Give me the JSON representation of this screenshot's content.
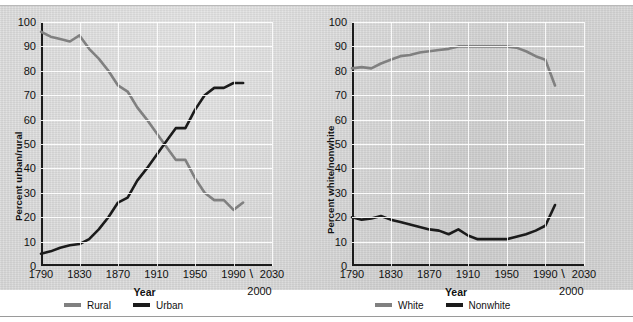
{
  "chart_data": [
    {
      "type": "line",
      "title": "",
      "xlabel": "Year",
      "ylabel": "Percent urban/rural",
      "xlim": [
        1790,
        2030
      ],
      "ylim": [
        0,
        100
      ],
      "grid": true,
      "legend_position": "bottom",
      "x_ticks": [
        "1790",
        "1830",
        "1870",
        "1910",
        "1950",
        "1990",
        "2030"
      ],
      "y_ticks": [
        "0",
        "10",
        "20",
        "30",
        "40",
        "50",
        "60",
        "70",
        "80",
        "90",
        "100"
      ],
      "annotation": "2000",
      "x": [
        1790,
        1800,
        1810,
        1820,
        1830,
        1840,
        1850,
        1860,
        1870,
        1880,
        1890,
        1900,
        1910,
        1920,
        1930,
        1940,
        1950,
        1960,
        1970,
        1980,
        1990,
        2000
      ],
      "series": [
        {
          "name": "Rural",
          "color": "#808080",
          "values": [
            96,
            94,
            93,
            92,
            94.5,
            89,
            85,
            80,
            74,
            71.5,
            65,
            60,
            54.5,
            49,
            43.5,
            43.5,
            36,
            30,
            27,
            27,
            23,
            26
          ]
        },
        {
          "name": "Urban",
          "color": "#1b1b1b",
          "values": [
            5,
            6,
            7.5,
            8.5,
            9,
            11,
            15,
            20,
            26,
            28,
            35,
            40,
            45.5,
            51,
            56.5,
            56.5,
            64,
            70,
            73,
            73,
            75,
            75
          ]
        }
      ]
    },
    {
      "type": "line",
      "title": "",
      "xlabel": "Year",
      "ylabel": "Percent white/nonwhite",
      "xlim": [
        1790,
        2030
      ],
      "ylim": [
        0,
        100
      ],
      "grid": true,
      "legend_position": "bottom",
      "x_ticks": [
        "1790",
        "1830",
        "1870",
        "1910",
        "1950",
        "1990",
        "2030"
      ],
      "y_ticks": [
        "0",
        "10",
        "20",
        "30",
        "40",
        "50",
        "60",
        "70",
        "80",
        "90",
        "100"
      ],
      "annotation": "2000",
      "x": [
        1790,
        1800,
        1810,
        1820,
        1830,
        1840,
        1850,
        1860,
        1870,
        1880,
        1890,
        1900,
        1910,
        1920,
        1930,
        1940,
        1950,
        1960,
        1970,
        1980,
        1990,
        2000
      ],
      "series": [
        {
          "name": "White",
          "color": "#808080",
          "values": [
            81,
            81.5,
            81,
            83,
            84.5,
            86,
            86.5,
            87.5,
            88,
            88.5,
            89,
            90,
            90,
            90,
            90,
            90,
            90,
            89.5,
            88,
            86,
            84.5,
            74
          ]
        },
        {
          "name": "Nonwhite",
          "color": "#1b1b1b",
          "values": [
            20,
            19,
            19.5,
            20.5,
            19,
            18,
            17,
            16,
            15,
            14.5,
            13,
            15,
            12.5,
            11,
            11,
            11,
            11,
            12,
            13,
            14.5,
            16.5,
            25
          ]
        }
      ]
    }
  ],
  "left_chart": {
    "ylabel": "Percent urban/rural",
    "xlabel": "Year",
    "pointer_note": "2000",
    "pointer_slash": "\\",
    "legend": [
      {
        "label": "Rural",
        "color": "#808080"
      },
      {
        "label": "Urban",
        "color": "#1b1b1b"
      }
    ]
  },
  "right_chart": {
    "ylabel": "Percent white/nonwhite",
    "xlabel": "Year",
    "pointer_note": "2000",
    "pointer_slash": "\\",
    "legend": [
      {
        "label": "White",
        "color": "#808080"
      },
      {
        "label": "Nonwhite",
        "color": "#1b1b1b"
      }
    ]
  }
}
